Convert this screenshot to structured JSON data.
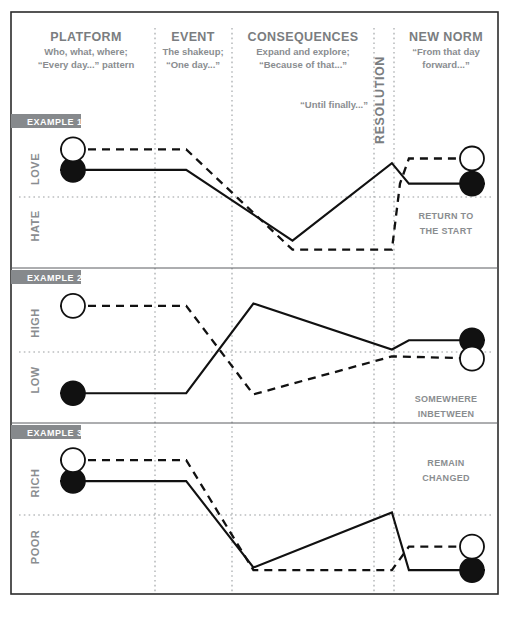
{
  "meta": {
    "colors": {
      "ink": "#111111",
      "frame": "#2b2b2b",
      "grey_text": "#8a8d90",
      "tab_bg": "#86898c",
      "dotted": "#9a9da0",
      "background": "#ffffff"
    }
  },
  "header": {
    "columns": [
      {
        "key": "platform",
        "title": "PLATFORM",
        "sub_lines": [
          "Who, what, where;",
          "“Every day...” pattern"
        ]
      },
      {
        "key": "event",
        "title": "EVENT",
        "sub_lines": [
          "The shakeup;",
          "“One day...”"
        ]
      },
      {
        "key": "consequences",
        "title": "CONSEQUENCES",
        "sub_lines": [
          "Expand and explore;",
          "“Because of that...”"
        ],
        "footnote": "“Until finally...”"
      },
      {
        "key": "resolution",
        "title": "RESOLUTION",
        "orientation": "vertical",
        "sub_lines": []
      },
      {
        "key": "new_norm",
        "title": "NEW NORM",
        "sub_lines": [
          "“From that day",
          "forward...”"
        ]
      }
    ]
  },
  "chart_data": {
    "type": "line",
    "xlabel": "Story stage",
    "ylabel": "Character state",
    "grid": "dotted vertical column dividers plus one dotted horizontal midline per panel",
    "legend": "solid line = character A; dashed line = character B; filled circle = start/end A; open circle = start/end B",
    "x_stages": [
      "Platform",
      "Event",
      "Consequences",
      "Resolution",
      "New Norm"
    ],
    "x_positions_pct": [
      0,
      29.7,
      45.5,
      78.1,
      82.1,
      100
    ],
    "panels": [
      {
        "id": "example-1",
        "tab_label": "EXAMPLE 1",
        "axis_top_label": "LOVE",
        "axis_bottom_label": "HATE",
        "note_lines": [
          "RETURN TO",
          "THE START"
        ],
        "series": [
          {
            "name": "solid",
            "style": "solid",
            "start_marker": "filled-circle",
            "end_marker": "filled-circle",
            "points": [
              {
                "x": 0.0,
                "y": 0.72
              },
              {
                "x": 0.297,
                "y": 0.72
              },
              {
                "x": 0.547,
                "y": 0.1
              },
              {
                "x": 0.781,
                "y": 0.78
              },
              {
                "x": 0.821,
                "y": 0.6
              },
              {
                "x": 1.0,
                "y": 0.6
              }
            ]
          },
          {
            "name": "dashed",
            "style": "dashed",
            "start_marker": "open-circle",
            "end_marker": "open-circle",
            "points": [
              {
                "x": 0.0,
                "y": 0.9
              },
              {
                "x": 0.297,
                "y": 0.9
              },
              {
                "x": 0.547,
                "y": 0.02
              },
              {
                "x": 0.781,
                "y": 0.02
              },
              {
                "x": 0.8,
                "y": 0.6
              },
              {
                "x": 0.821,
                "y": 0.82
              },
              {
                "x": 1.0,
                "y": 0.82
              }
            ]
          }
        ]
      },
      {
        "id": "example-2",
        "tab_label": "EXAMPLE 2",
        "axis_top_label": "HIGH",
        "axis_bottom_label": "LOW",
        "note_lines": [
          "SOMEWHERE",
          "INBETWEEN"
        ],
        "series": [
          {
            "name": "solid",
            "style": "solid",
            "start_marker": "filled-circle",
            "end_marker": "filled-circle",
            "points": [
              {
                "x": 0.0,
                "y": 0.12
              },
              {
                "x": 0.297,
                "y": 0.12
              },
              {
                "x": 0.455,
                "y": 0.9
              },
              {
                "x": 0.781,
                "y": 0.5
              },
              {
                "x": 0.821,
                "y": 0.58
              },
              {
                "x": 1.0,
                "y": 0.58
              }
            ]
          },
          {
            "name": "dashed",
            "style": "dashed",
            "start_marker": "open-circle",
            "end_marker": "open-circle",
            "points": [
              {
                "x": 0.0,
                "y": 0.88
              },
              {
                "x": 0.297,
                "y": 0.88
              },
              {
                "x": 0.455,
                "y": 0.11
              },
              {
                "x": 0.781,
                "y": 0.44
              },
              {
                "x": 1.0,
                "y": 0.42
              }
            ]
          }
        ]
      },
      {
        "id": "example-3",
        "tab_label": "EXAMPLE 3",
        "axis_top_label": "RICH",
        "axis_bottom_label": "POOR",
        "note_lines": [
          "REMAIN",
          "CHANGED"
        ],
        "series": [
          {
            "name": "solid",
            "style": "solid",
            "start_marker": "filled-circle",
            "end_marker": "filled-circle",
            "points": [
              {
                "x": 0.0,
                "y": 0.74
              },
              {
                "x": 0.297,
                "y": 0.74
              },
              {
                "x": 0.455,
                "y": 0.08
              },
              {
                "x": 0.781,
                "y": 0.5
              },
              {
                "x": 0.821,
                "y": 0.06
              },
              {
                "x": 1.0,
                "y": 0.06
              }
            ]
          },
          {
            "name": "dashed",
            "style": "dashed",
            "start_marker": "open-circle",
            "end_marker": "open-circle",
            "points": [
              {
                "x": 0.0,
                "y": 0.9
              },
              {
                "x": 0.297,
                "y": 0.9
              },
              {
                "x": 0.455,
                "y": 0.06
              },
              {
                "x": 0.781,
                "y": 0.06
              },
              {
                "x": 0.821,
                "y": 0.24
              },
              {
                "x": 1.0,
                "y": 0.24
              }
            ]
          }
        ]
      }
    ]
  }
}
